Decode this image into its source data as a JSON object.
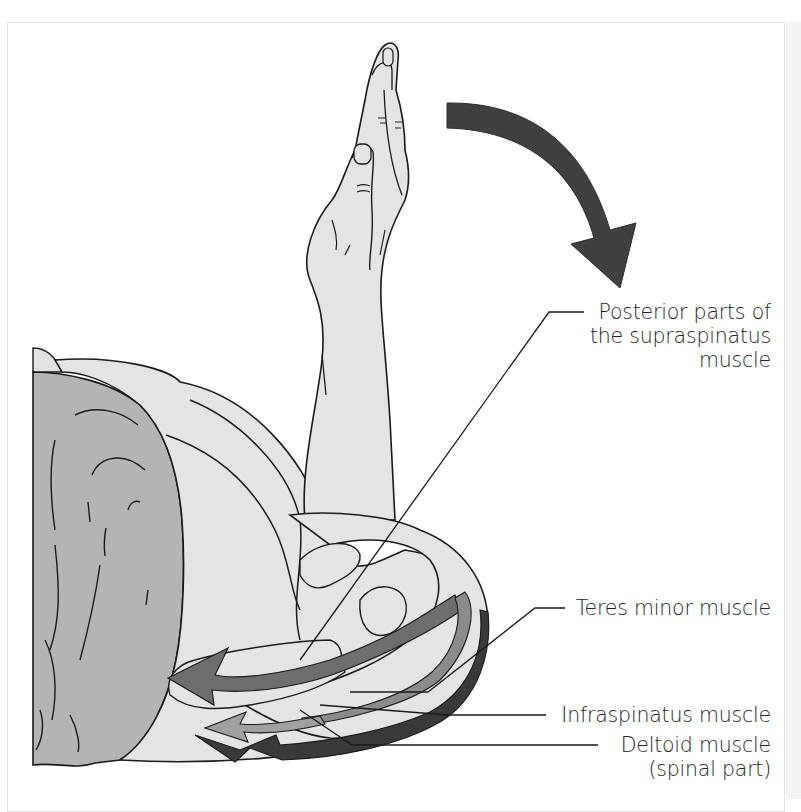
{
  "figure": {
    "motion_arrow": {
      "direction": "clockwise-down",
      "color": "#404040"
    },
    "colors": {
      "skin": "#e3e3e3",
      "body_dark": "#b3b3b3",
      "outline": "#1a1a1a",
      "supraspinatus_arrow": "#6e6e6e",
      "teres_minor_arrow": "#8c8c8c",
      "infraspinatus_arrow": "#9a9a9a",
      "deltoid_arrow": "#3a3a3a"
    },
    "labels": [
      {
        "id": "supraspinatus",
        "lines": [
          "Posterior parts of",
          "the supraspinatus",
          "muscle"
        ]
      },
      {
        "id": "teres_minor",
        "lines": [
          "Teres minor muscle"
        ]
      },
      {
        "id": "infraspinatus",
        "lines": [
          "Infraspinatus muscle"
        ]
      },
      {
        "id": "deltoid",
        "lines": [
          "Deltoid muscle",
          "(spinal part)"
        ]
      }
    ]
  }
}
